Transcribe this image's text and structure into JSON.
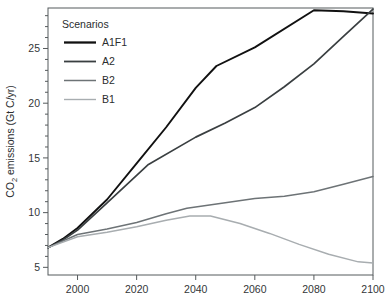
{
  "chart_data": {
    "type": "line",
    "title": "",
    "xlabel": "",
    "ylabel": "CO2 emissions (Gt C/yr)",
    "ylabel_main": "CO",
    "ylabel_sub": "2",
    "ylabel_rest": " emissions (Gt C/yr)",
    "xlim": [
      1990,
      2100
    ],
    "ylim": [
      4.3,
      28.7
    ],
    "grid": false,
    "legend_position": "top-left",
    "legend_title": "Scenarios",
    "xticks": [
      2000,
      2020,
      2040,
      2060,
      2080,
      2100
    ],
    "xtick_labels": [
      "2000",
      "2020",
      "2040",
      "2060",
      "2080",
      "2100"
    ],
    "yticks": [
      5,
      10,
      15,
      20,
      25
    ],
    "ytick_labels": [
      "5",
      "10",
      "15",
      "20",
      "25"
    ],
    "yminor_ticks": [
      6,
      7,
      8,
      9,
      11,
      12,
      13,
      14,
      16,
      17,
      18,
      19,
      21,
      22,
      23,
      24,
      26,
      27,
      28
    ],
    "series": [
      {
        "name": "A1F1",
        "color": "#111111",
        "width": 1.9,
        "x": [
          1990,
          1995,
          2000,
          2005,
          2010,
          2020,
          2030,
          2040,
          2047,
          2060,
          2080,
          2090,
          2100
        ],
        "values": [
          6.8,
          7.6,
          8.6,
          9.9,
          11.2,
          14.5,
          17.8,
          21.4,
          23.4,
          25.1,
          28.5,
          28.4,
          28.2
        ]
      },
      {
        "name": "A2",
        "color": "#3a3f41",
        "width": 1.7,
        "x": [
          1990,
          1995,
          2000,
          2010,
          2020,
          2024,
          2040,
          2050,
          2060,
          2070,
          2080,
          2090,
          2100
        ],
        "values": [
          6.8,
          7.5,
          8.4,
          10.9,
          13.4,
          14.4,
          16.9,
          18.2,
          19.6,
          21.5,
          23.6,
          26.1,
          28.6
        ]
      },
      {
        "name": "B2",
        "color": "#6d7376",
        "width": 1.5,
        "x": [
          1990,
          2000,
          2010,
          2020,
          2030,
          2037,
          2050,
          2060,
          2070,
          2080,
          2090,
          2100
        ],
        "values": [
          6.8,
          8.0,
          8.5,
          9.1,
          9.9,
          10.4,
          10.9,
          11.3,
          11.5,
          11.9,
          12.6,
          13.3
        ]
      },
      {
        "name": "B1",
        "color": "#a8adb0",
        "width": 1.5,
        "x": [
          1990,
          2000,
          2010,
          2020,
          2030,
          2038,
          2045,
          2055,
          2065,
          2075,
          2085,
          2095,
          2100
        ],
        "values": [
          6.8,
          7.8,
          8.2,
          8.7,
          9.3,
          9.7,
          9.7,
          9.0,
          8.1,
          7.1,
          6.2,
          5.5,
          5.4
        ]
      }
    ]
  },
  "legend": {
    "title": "Scenarios",
    "items": [
      {
        "label": "A1F1",
        "color": "#111111",
        "width": 2.3
      },
      {
        "label": "A2",
        "color": "#3a3f41",
        "width": 1.8
      },
      {
        "label": "B2",
        "color": "#6d7376",
        "width": 1.5
      },
      {
        "label": "B1",
        "color": "#a8adb0",
        "width": 1.4
      }
    ]
  }
}
